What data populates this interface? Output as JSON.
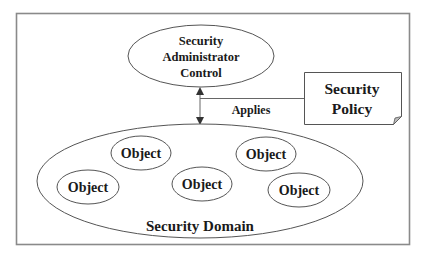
{
  "diagram": {
    "admin_control": {
      "lines": [
        "Security",
        "Administrator",
        "Control"
      ]
    },
    "relation": {
      "label": "Applies"
    },
    "policy": {
      "lines": [
        "Security",
        "Policy"
      ]
    },
    "domain": {
      "label": "Security Domain",
      "objects": [
        {
          "label": "Object"
        },
        {
          "label": "Object"
        },
        {
          "label": "Object"
        },
        {
          "label": "Object"
        },
        {
          "label": "Object"
        }
      ]
    }
  },
  "colors": {
    "stroke": "#555555",
    "frame": "#8a8a8a",
    "text": "#1a1a1a",
    "background": "#ffffff"
  }
}
